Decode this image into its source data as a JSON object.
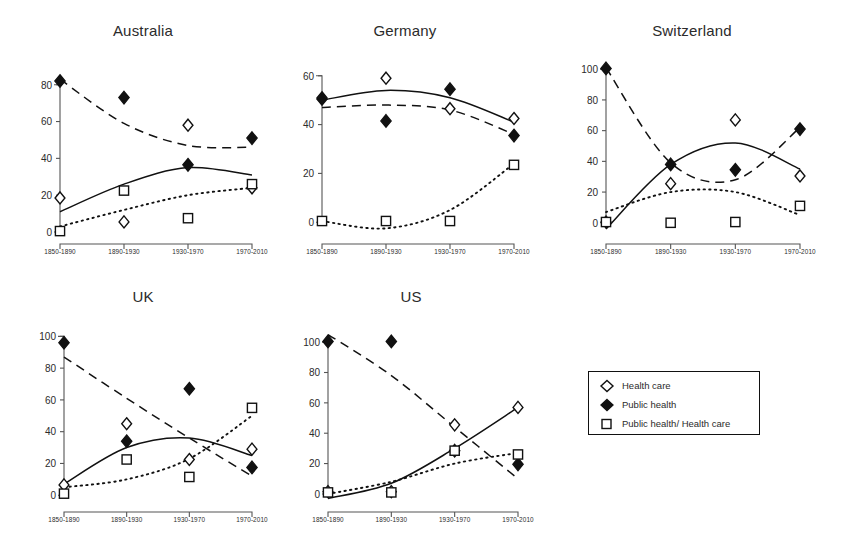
{
  "figure": {
    "background": "#ffffff",
    "ink_color": "#111111",
    "panel_titles": [
      "Australia",
      "Germany",
      "Switzerland",
      "UK",
      "US"
    ]
  },
  "legend": {
    "position": "bottom-right",
    "entries": [
      {
        "marker": "open-diamond",
        "label": "Health care"
      },
      {
        "marker": "filled-diamond",
        "label": "Public health"
      },
      {
        "marker": "open-square",
        "label": "Public health/ Health care"
      }
    ]
  },
  "chart_data": [
    {
      "type": "scatter",
      "title": "Australia",
      "xlabel": "",
      "ylabel": "",
      "categories": [
        "1850-1890",
        "1890-1930",
        "1930-1970",
        "1970-2010"
      ],
      "ylim": [
        0,
        88
      ],
      "yticks": [
        0,
        20,
        40,
        60,
        80
      ],
      "grid": false,
      "series": [
        {
          "name": "Health care",
          "marker": "open-diamond",
          "trend": "solid",
          "values": [
            18.5,
            5.5,
            58,
            24
          ]
        },
        {
          "name": "Public health",
          "marker": "filled-diamond",
          "trend": "dashed",
          "values": [
            82,
            73,
            36.5,
            51
          ]
        },
        {
          "name": "Public health/ Health care",
          "marker": "open-square",
          "trend": "dotted",
          "values": [
            0.5,
            22.5,
            7.5,
            26
          ]
        }
      ],
      "trend_curves": {
        "solid": [
          11,
          26,
          35,
          31
        ],
        "dashed": [
          83,
          59,
          47,
          46
        ],
        "dotted": [
          3,
          12,
          20,
          24
        ]
      }
    },
    {
      "type": "scatter",
      "title": "Germany",
      "xlabel": "",
      "ylabel": "",
      "categories": [
        "1850-1890",
        "1890-1930",
        "1930-1970",
        "1970-2010"
      ],
      "ylim": [
        -4,
        64
      ],
      "yticks": [
        0,
        20,
        40,
        60
      ],
      "grid": false,
      "series": [
        {
          "name": "Health care",
          "marker": "open-diamond",
          "trend": "solid",
          "values": [
            51,
            59,
            46.5,
            42.5
          ]
        },
        {
          "name": "Public health",
          "marker": "filled-diamond",
          "trend": "dashed",
          "values": [
            50.5,
            41.5,
            54.5,
            35.5
          ]
        },
        {
          "name": "Public health/ Health care",
          "marker": "open-square",
          "trend": "dotted",
          "values": [
            0.5,
            0.5,
            0.5,
            23.5
          ]
        }
      ],
      "trend_curves": {
        "solid": [
          50,
          54,
          51,
          41
        ],
        "dashed": [
          47,
          48,
          46,
          36
        ],
        "dotted": [
          0.5,
          -2.5,
          5,
          24
        ]
      }
    },
    {
      "type": "scatter",
      "title": "Switzerland",
      "xlabel": "",
      "ylabel": "",
      "categories": [
        "1850-1890",
        "1890-1930",
        "1930-1970",
        "1970-2010"
      ],
      "ylim": [
        -6,
        106
      ],
      "yticks": [
        0,
        20,
        40,
        60,
        80,
        100
      ],
      "grid": false,
      "series": [
        {
          "name": "Health care",
          "marker": "open-diamond",
          "trend": "solid",
          "values": [
            0.5,
            25.5,
            67,
            30.5
          ]
        },
        {
          "name": "Public health",
          "marker": "filled-diamond",
          "trend": "dashed",
          "values": [
            100.5,
            38,
            34.5,
            61
          ]
        },
        {
          "name": "Public health/ Health care",
          "marker": "open-square",
          "trend": "dotted",
          "values": [
            0.5,
            0,
            0.5,
            11
          ]
        }
      ],
      "trend_curves": {
        "solid": [
          -4,
          38,
          52,
          35
        ],
        "dashed": [
          101,
          39,
          28,
          62
        ],
        "dotted": [
          7,
          20,
          20,
          5
        ]
      }
    },
    {
      "type": "scatter",
      "title": "UK",
      "xlabel": "",
      "ylabel": "",
      "categories": [
        "1850-1890",
        "1890-1930",
        "1930-1970",
        "1970-2010"
      ],
      "ylim": [
        -3,
        104
      ],
      "yticks": [
        0,
        20,
        40,
        60,
        80,
        100
      ],
      "grid": false,
      "series": [
        {
          "name": "Health care",
          "marker": "open-diamond",
          "trend": "solid",
          "values": [
            6.5,
            45,
            22.5,
            29
          ]
        },
        {
          "name": "Public health",
          "marker": "filled-diamond",
          "trend": "dashed",
          "values": [
            96,
            34,
            67,
            17.5
          ]
        },
        {
          "name": "Public health/ Health care",
          "marker": "open-square",
          "trend": "dotted",
          "values": [
            1,
            22.5,
            11.5,
            55
          ]
        }
      ],
      "trend_curves": {
        "solid": [
          7,
          30,
          36,
          25
        ],
        "dashed": [
          87,
          61,
          36,
          12
        ],
        "dotted": [
          5,
          10,
          23,
          50
        ]
      }
    },
    {
      "type": "scatter",
      "title": "US",
      "xlabel": "",
      "ylabel": "",
      "categories": [
        "1850-1890",
        "1890-1930",
        "1930-1970",
        "1970-2010"
      ],
      "ylim": [
        -4,
        108
      ],
      "yticks": [
        0,
        20,
        40,
        60,
        80,
        100
      ],
      "grid": false,
      "series": [
        {
          "name": "Health care",
          "marker": "open-diamond",
          "trend": "solid",
          "values": [
            1.5,
            1.5,
            45.5,
            57
          ]
        },
        {
          "name": "Public health",
          "marker": "filled-diamond",
          "trend": "dashed",
          "values": [
            100.5,
            100.5,
            28.5,
            19.5
          ]
        },
        {
          "name": "Public health/ Health care",
          "marker": "open-square",
          "trend": "dotted",
          "values": [
            1,
            1,
            28.5,
            26
          ]
        }
      ],
      "trend_curves": {
        "solid": [
          -3,
          7,
          30,
          57
        ],
        "dashed": [
          105,
          78,
          44,
          10
        ],
        "dotted": [
          0,
          8,
          20,
          27
        ]
      }
    }
  ]
}
